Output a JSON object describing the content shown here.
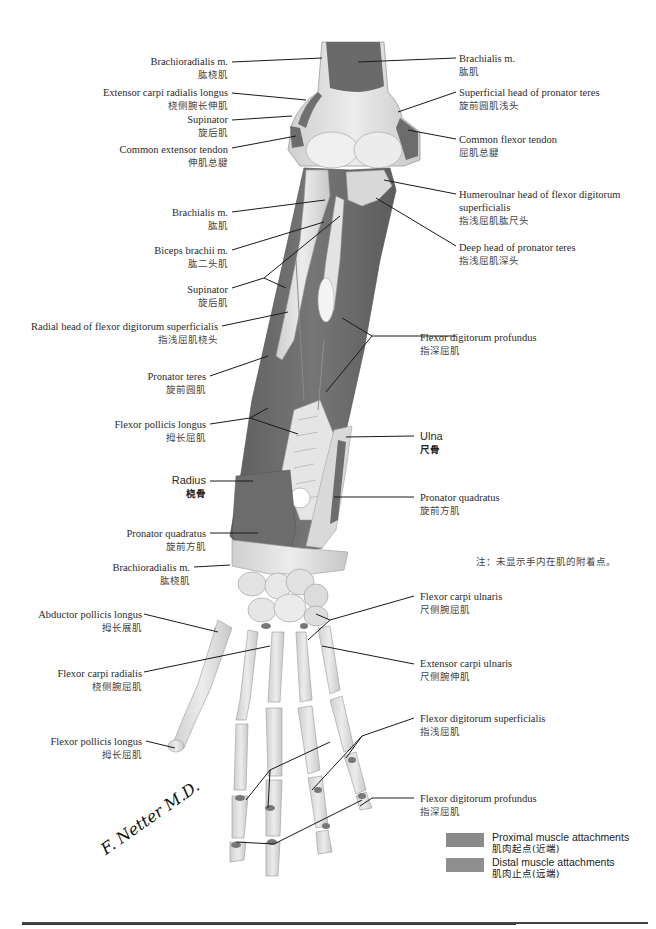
{
  "figure": {
    "colors": {
      "proximal_attachment": "#8a8a8a",
      "distal_attachment": "#8f8f8f",
      "muscle_fill": "#6e6e6e",
      "bone_fill": "#e4e4e4",
      "bone_shade": "#c9c9c9",
      "leader_line": "#1a1a1a"
    }
  },
  "labels_left": [
    {
      "en": "Brachioradialis m.",
      "zh": "肱桡肌"
    },
    {
      "en": "Extensor carpi radialis longus",
      "zh": "桡侧腕长伸肌"
    },
    {
      "en": "Supinator",
      "zh": "旋后肌"
    },
    {
      "en": "Common extensor tendon",
      "zh": "伸肌总腱"
    },
    {
      "en": "Brachialis m.",
      "zh": "肱肌"
    },
    {
      "en": "Biceps brachii m.",
      "zh": "肱二头肌"
    },
    {
      "en": "Supinator",
      "zh": "旋后肌"
    },
    {
      "en": "Radial head of flexor digitorum superficialis",
      "zh": "指浅屈肌桡头"
    },
    {
      "en": "Pronator teres",
      "zh": "旋前圆肌"
    },
    {
      "en": "Flexor pollicis longus",
      "zh": "拇长屈肌"
    },
    {
      "en": "Radius",
      "zh": "桡骨"
    },
    {
      "en": "Pronator quadratus",
      "zh": "旋前方肌"
    },
    {
      "en": "Brachioradialis m.",
      "zh": "肱桡肌"
    },
    {
      "en": "Abductor pollicis longus",
      "zh": "拇长展肌"
    },
    {
      "en": "Flexor carpi radialis",
      "zh": "桡侧腕屈肌"
    },
    {
      "en": "Flexor pollicis longus",
      "zh": "拇长屈肌"
    }
  ],
  "labels_right": [
    {
      "en": "Brachialis m.",
      "zh": "肱肌"
    },
    {
      "en": "Superficial head of pronator teres",
      "zh": "旋前圆肌浅头"
    },
    {
      "en": "Common flexor tendon",
      "zh": "屈肌总腱"
    },
    {
      "en": "Humeroulnar head of flexor digitorum",
      "en2": "superficialis",
      "zh": "指浅屈肌肱尺头"
    },
    {
      "en": "Deep head of pronator teres",
      "zh": "指浅屈肌深头"
    },
    {
      "en": "Flexor digitorum profundus",
      "zh": "指深屈肌"
    },
    {
      "en": "Ulna",
      "zh": "尺骨"
    },
    {
      "en": "Pronator quadratus",
      "zh": "旋前方肌"
    },
    {
      "en": "Flexor carpi ulnaris",
      "zh": "尺侧腕屈肌"
    },
    {
      "en": "Extensor carpi ulnaris",
      "zh": "尺侧腕伸肌"
    },
    {
      "en": "Flexor digitorum superficialis",
      "zh": "指浅屈肌"
    },
    {
      "en": "Flexor digitorum profundus",
      "zh": "指深屈肌"
    }
  ],
  "note": "注：未显示手内在肌的附着点。",
  "legend": [
    {
      "en": "Proximal muscle attachments",
      "zh": "肌肉起点(近端)",
      "color": "#8a8a8a"
    },
    {
      "en": "Distal muscle attachments",
      "zh": "肌肉止点(远端)",
      "color": "#8f8f8f"
    }
  ],
  "signature": "F. Netter M.D."
}
